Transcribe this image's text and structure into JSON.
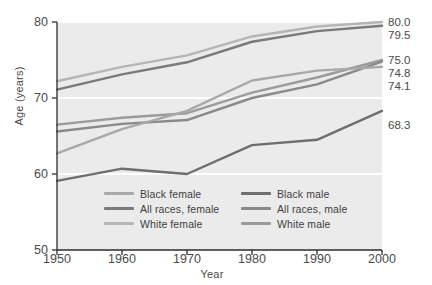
{
  "chart_data": {
    "type": "line",
    "title": "",
    "subtitle": "",
    "xlabel": "Year",
    "ylabel": "Age (years)",
    "x": [
      1950,
      1960,
      1970,
      1980,
      1990,
      2000
    ],
    "xlim": [
      1950,
      2000
    ],
    "ylim": [
      50,
      80
    ],
    "xticks": [
      "1950",
      "1960",
      "1970",
      "1980",
      "1990",
      "2000"
    ],
    "yticks": [
      "50",
      "60",
      "70",
      "80"
    ],
    "grid": "horizontal-white-gridlines",
    "legend_position": "inside-bottom-center",
    "plot_background": "#ebebeb",
    "gridline_color": "#ffffff",
    "series": [
      {
        "name": "White female",
        "color": "#b5b5b5",
        "values": [
          72.2,
          74.1,
          75.6,
          78.1,
          79.4,
          80.0
        ],
        "end_label": "80.0"
      },
      {
        "name": "All races, female",
        "color": "#7a7a7a",
        "values": [
          71.1,
          73.1,
          74.7,
          77.4,
          78.8,
          79.5
        ],
        "end_label": "79.5"
      },
      {
        "name": "White male",
        "color": "#9b9b9b",
        "values": [
          66.5,
          67.4,
          68.0,
          70.7,
          72.7,
          75.0
        ],
        "end_label": "75.0"
      },
      {
        "name": "All races, male",
        "color": "#8a8a8a",
        "values": [
          65.6,
          66.6,
          67.1,
          70.0,
          71.8,
          74.8
        ],
        "end_label": "74.8"
      },
      {
        "name": "Black female",
        "color": "#a8a8a8",
        "values": [
          62.7,
          65.9,
          68.3,
          72.3,
          73.6,
          74.1
        ],
        "end_label": "74.1"
      },
      {
        "name": "Black male",
        "color": "#6e6e6e",
        "values": [
          59.1,
          60.7,
          60.0,
          63.8,
          64.5,
          68.3
        ],
        "end_label": "68.3"
      }
    ],
    "end_labels": [
      {
        "text": "80.0",
        "value": 80.0
      },
      {
        "text": "79.5",
        "value": 79.5
      },
      {
        "text": "75.0",
        "value": 75.0
      },
      {
        "text": "74.8",
        "value": 74.8
      },
      {
        "text": "74.1",
        "value": 74.1
      },
      {
        "text": "68.3",
        "value": 68.3
      }
    ],
    "legend": [
      {
        "label": "Black female",
        "color": "#a8a8a8",
        "column": "left"
      },
      {
        "label": "Black male",
        "color": "#6e6e6e",
        "column": "right"
      },
      {
        "label": "All races, female",
        "color": "#7a7a7a",
        "column": "left"
      },
      {
        "label": "All races, male",
        "color": "#8a8a8a",
        "column": "right"
      },
      {
        "label": "White female",
        "color": "#b5b5b5",
        "column": "left"
      },
      {
        "label": "White male",
        "color": "#9b9b9b",
        "column": "right"
      }
    ]
  }
}
